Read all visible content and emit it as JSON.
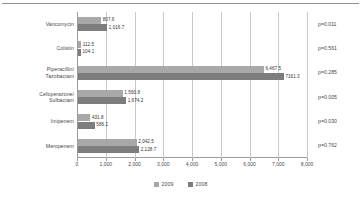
{
  "chart_data": {
    "type": "bar",
    "orientation": "horizontal",
    "title": "",
    "xlabel": "",
    "ylabel": "",
    "xlim": [
      0,
      8000
    ],
    "xticks": [
      0,
      1000,
      2000,
      3000,
      4000,
      5000,
      6000,
      7000,
      8000
    ],
    "xtick_labels": [
      "0",
      "1,000",
      "2,000",
      "3,000",
      "4,000",
      "5,000",
      "6,000",
      "7,000",
      "8,000"
    ],
    "grid": true,
    "grid_axis": "x",
    "legend_position": "bottom",
    "categories": [
      "Vancomycin",
      "Colistin",
      "Piperacillin/ Tazobactam",
      "Cefoperazone/ Sulbactam",
      "Imipenem",
      "Meropenem"
    ],
    "category_lines": [
      [
        "Vancomycin"
      ],
      [
        "Colistin"
      ],
      [
        "Piperacillin/",
        "Tazobactam"
      ],
      [
        "Cefoperazone/",
        "Sulbactam"
      ],
      [
        "Imipenem"
      ],
      [
        "Meropenem"
      ]
    ],
    "series": [
      {
        "name": "2009",
        "color": "#a8a8a8",
        "values": [
          807.6,
          112.5,
          6467.5,
          1560.8,
          431.8,
          2042.5
        ],
        "labels": [
          "807.6",
          "112.5",
          "6,467.5",
          "1,560.8",
          "431.8",
          "2,042.5"
        ]
      },
      {
        "name": "2008",
        "color": "#7d7d7d",
        "values": [
          1016.7,
          104.1,
          7161.3,
          1674.2,
          586.1,
          2128.7
        ],
        "labels": [
          "1,016.7",
          "104.1",
          "7161.3",
          "1,674.2",
          "586.1",
          "2,128.7"
        ]
      }
    ],
    "annotations": {
      "label": "p-value",
      "values": [
        "p=0.011",
        "p=0.561",
        "p=0.285",
        "p=0.005",
        "p=0.030",
        "p=0.762"
      ]
    }
  },
  "legend": {
    "entries": [
      {
        "label": "2009",
        "color": "#a8a8a8"
      },
      {
        "label": "2008",
        "color": "#7d7d7d"
      }
    ]
  }
}
